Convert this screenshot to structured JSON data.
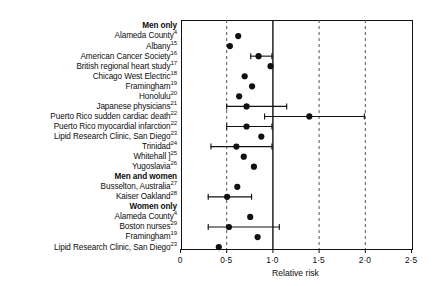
{
  "chart_data": {
    "type": "scatter",
    "title": "",
    "xlabel": "Relative risk",
    "ylabel": "",
    "xlim": [
      0,
      2.5
    ],
    "xticks": [
      0,
      0.5,
      1.0,
      1.5,
      2.0,
      2.5
    ],
    "xtick_labels": [
      "0",
      "0·5",
      "1·0",
      "1·5",
      "2·0",
      "2·5"
    ],
    "grid": "vertical dashed gridlines at 0.5, 1.5, 2.0; solid reference line at 1.0",
    "reference_line": 1.0,
    "dashed_lines": [
      0.5,
      1.5,
      2.0
    ],
    "legend": "none",
    "groups": [
      {
        "name": "Men only",
        "rows": [
          {
            "label": "Alameda County",
            "ref": "4",
            "value": 0.63,
            "ci": null
          },
          {
            "label": "Albany",
            "ref": "15",
            "value": 0.54,
            "ci": null
          },
          {
            "label": "American Cancer Society",
            "ref": "16",
            "value": 0.85,
            "ci": [
              0.76,
              1.0
            ]
          },
          {
            "label": "British regional heart study",
            "ref": "17",
            "value": 0.98,
            "ci": null
          },
          {
            "label": "Chicago West Electric",
            "ref": "18",
            "value": 0.7,
            "ci": null
          },
          {
            "label": "Framingham",
            "ref": "19",
            "value": 0.78,
            "ci": null
          },
          {
            "label": "Honolulu",
            "ref": "20",
            "value": 0.64,
            "ci": null
          },
          {
            "label": "Japanese physicians",
            "ref": "21",
            "value": 0.72,
            "ci": [
              0.5,
              1.16
            ]
          },
          {
            "label": "Puerto Rico sudden cardiac death",
            "ref": "22",
            "value": 1.4,
            "ci": [
              0.91,
              2.0
            ]
          },
          {
            "label": "Puerto Rico myocardial infarction",
            "ref": "22",
            "value": 0.72,
            "ci": [
              0.5,
              1.0
            ]
          },
          {
            "label": "Lipid Research Clinic, San Diego",
            "ref": "23",
            "value": 0.88,
            "ci": null
          },
          {
            "label": "Trinidad",
            "ref": "24",
            "value": 0.61,
            "ci": [
              0.33,
              1.0
            ]
          },
          {
            "label": "Whitehall ]",
            "ref": "25",
            "value": 0.69,
            "ci": null
          },
          {
            "label": "Yugoslavia",
            "ref": "26",
            "value": 0.8,
            "ci": null
          }
        ]
      },
      {
        "name": "Men and women",
        "rows": [
          {
            "label": "Busselton, Australia",
            "ref": "27",
            "value": 0.62,
            "ci": null
          },
          {
            "label": "Kaiser Oakland",
            "ref": "28",
            "value": 0.51,
            "ci": [
              0.3,
              0.78
            ]
          }
        ]
      },
      {
        "name": "Women only",
        "rows": [
          {
            "label": "Alameda County",
            "ref": "4",
            "value": 0.76,
            "ci": null
          },
          {
            "label": "Boston nurses",
            "ref": "29",
            "value": 0.53,
            "ci": [
              0.3,
              1.08
            ]
          },
          {
            "label": "Framingham",
            "ref": "19",
            "value": 0.84,
            "ci": null
          },
          {
            "label": "Lipid Research Clinic, San Diego",
            "ref": "23",
            "value": 0.42,
            "ci": null
          }
        ]
      }
    ]
  },
  "colors": {
    "marker": "#111111",
    "axis": "#111111",
    "reference": "#111111",
    "gridline": "#555555",
    "background": "#ffffff"
  }
}
